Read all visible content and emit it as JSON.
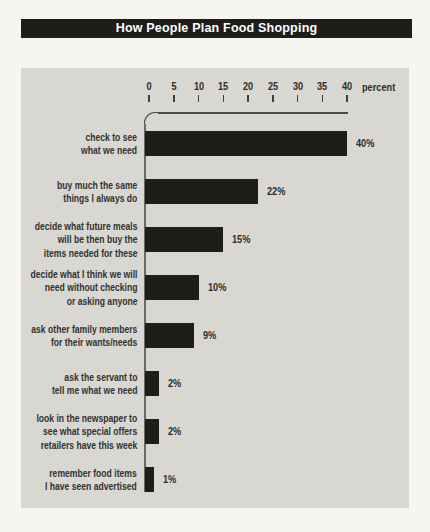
{
  "page": {
    "background": "#f7f5ef",
    "panel_background": "#d8d7d2"
  },
  "chart_data": {
    "type": "bar",
    "orientation": "horizontal",
    "title": "How People Plan Food Shopping",
    "xlabel": "percent",
    "xlim": [
      0,
      40
    ],
    "axis_ticks": [
      0,
      5,
      10,
      15,
      20,
      25,
      30,
      35,
      40
    ],
    "grid": false,
    "bar_color": "#1e1d1b",
    "title_bg": "#1e1d1b",
    "title_color": "#ffffff",
    "rows": [
      {
        "label_lines": [
          "check to see",
          "what we need"
        ],
        "value": 40,
        "value_label": "40%"
      },
      {
        "label_lines": [
          "buy much the same",
          "things I always do"
        ],
        "value": 22,
        "value_label": "22%"
      },
      {
        "label_lines": [
          "decide what future meals",
          "will be then buy the",
          "items needed for these"
        ],
        "value": 15,
        "value_label": "15%"
      },
      {
        "label_lines": [
          "decide what I think we will",
          "need without checking",
          "or asking anyone"
        ],
        "value": 10,
        "value_label": "10%"
      },
      {
        "label_lines": [
          "ask other family members",
          "for their wants/needs"
        ],
        "value": 9,
        "value_label": "9%"
      },
      {
        "label_lines": [
          "ask the servant to",
          "tell me what we need"
        ],
        "value": 2,
        "value_label": "2%"
      },
      {
        "label_lines": [
          "look in the newspaper to",
          "see what special offers",
          "retailers have this week"
        ],
        "value": 2,
        "value_label": "2%"
      },
      {
        "label_lines": [
          "remember food items",
          "I have seen advertised"
        ],
        "value": 1,
        "value_label": "1%"
      }
    ]
  }
}
